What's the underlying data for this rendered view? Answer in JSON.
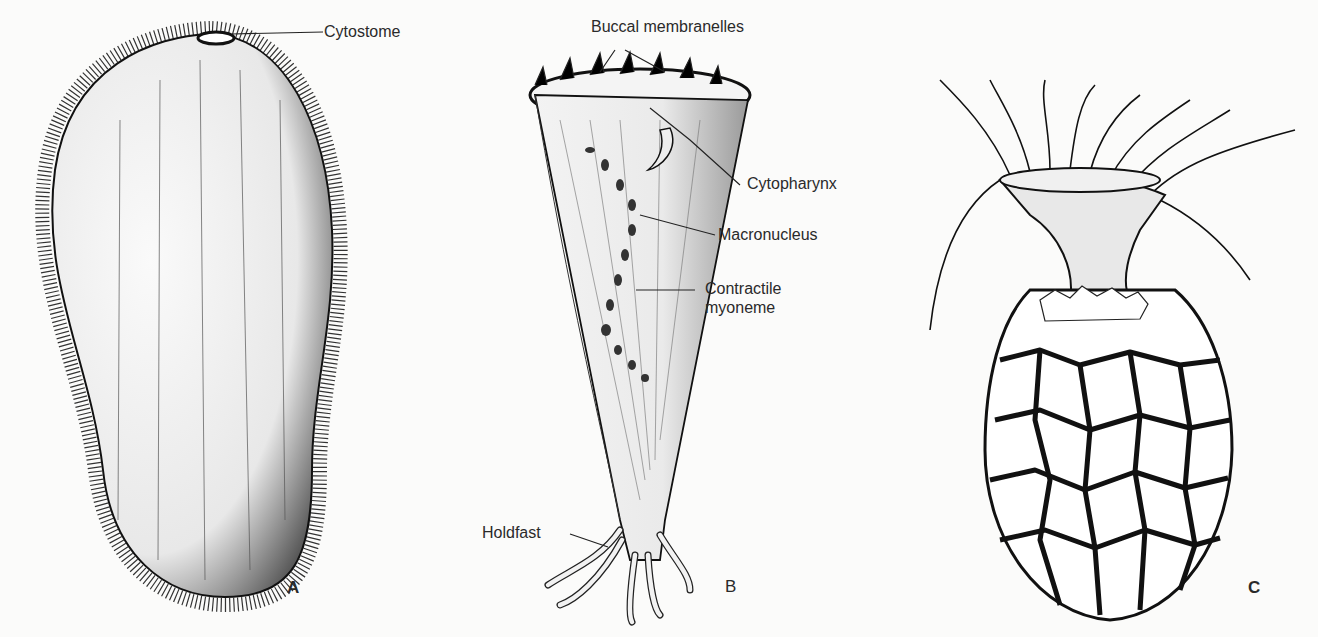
{
  "figures": [
    {
      "id": "A",
      "letter": "A",
      "labels": {
        "cytostome": "Cytostome"
      }
    },
    {
      "id": "B",
      "letter": "B",
      "labels": {
        "buccal": "Buccal membranelles",
        "cytopharynx": "Cytopharynx",
        "macronucleus": "Macronucleus",
        "myoneme_1": "Contractile",
        "myoneme_2": "myoneme",
        "holdfast": "Holdfast"
      }
    },
    {
      "id": "C",
      "letter": "C"
    }
  ],
  "colors": {
    "ink": "#1e1e1e",
    "paper": "#fbfbfa"
  }
}
